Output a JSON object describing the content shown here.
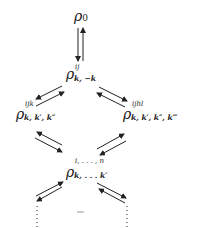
{
  "diagram": {
    "nodes": [
      {
        "id": "rho0",
        "symbol": "ρ",
        "sup": "",
        "sub": "0"
      },
      {
        "id": "rho2",
        "symbol": "ρ",
        "sup": "ij",
        "sub": "k, −k"
      },
      {
        "id": "rho3",
        "symbol": "ρ",
        "sup": "ijk",
        "sub": "k, k′, k″"
      },
      {
        "id": "rho4",
        "symbol": "ρ",
        "sup": "ijhl",
        "sub": "k, k′, k″, k‴"
      },
      {
        "id": "rhon",
        "symbol": "ρ",
        "sup": "i, . . . , n",
        "sub": "k, . . . k′"
      }
    ],
    "edges": [
      {
        "from": "rho0",
        "to": "rho2",
        "type": "bidirectional"
      },
      {
        "from": "rho2",
        "to": "rho3",
        "type": "bidirectional"
      },
      {
        "from": "rho2",
        "to": "rho4",
        "type": "bidirectional"
      },
      {
        "from": "rho3",
        "to": "rhon",
        "type": "bidirectional"
      },
      {
        "from": "rho4",
        "to": "rhon",
        "type": "bidirectional"
      },
      {
        "from": "rhon",
        "to": "continuation-left",
        "type": "bidirectional"
      },
      {
        "from": "rhon",
        "to": "continuation-right",
        "type": "bidirectional"
      }
    ],
    "continuation": "⋮"
  }
}
